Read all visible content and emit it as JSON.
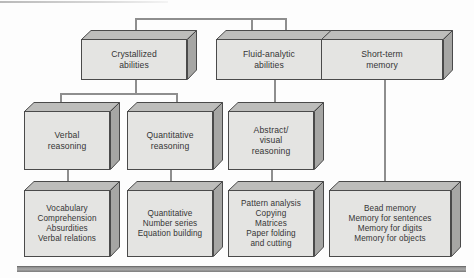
{
  "diagram": {
    "colors": {
      "box_front": "#e4e4e2",
      "box_top": "#bdbdbb",
      "box_side": "#a6a6a4",
      "box_outline": "#4a4a4a",
      "connector": "#8e8e8e",
      "bottom_bar": "#8c8c8c",
      "text": "#353535",
      "background": "#fdfdfd"
    },
    "level1": [
      {
        "id": "crystallized",
        "label": "Crystallized\nabilities"
      },
      {
        "id": "fluid-analytic",
        "label": "Fluid-analytic\nabilities"
      },
      {
        "id": "short-term-memory",
        "label": "Short-term\nmemory"
      }
    ],
    "level2": [
      {
        "id": "verbal-reasoning",
        "label": "Verbal\nreasoning"
      },
      {
        "id": "quantitative-reasoning",
        "label": "Quantitative\nreasoning"
      },
      {
        "id": "abstract-visual-reasoning",
        "label": "Abstract/\nvisual\nreasoning"
      }
    ],
    "level3": [
      {
        "id": "verbal-subtests",
        "label": "Vocabulary\nComprehension\nAbsurdities\nVerbal relations"
      },
      {
        "id": "quantitative-subtests",
        "label": "Quantitative\nNumber series\nEquation building"
      },
      {
        "id": "abstract-visual-subtests",
        "label": "Pattern analysis\nCopying\nMatrices\nPaper folding\nand cutting"
      },
      {
        "id": "memory-subtests",
        "label": "Bead memory\nMemory for sentences\nMemory for digits\nMemory for objects"
      }
    ]
  }
}
